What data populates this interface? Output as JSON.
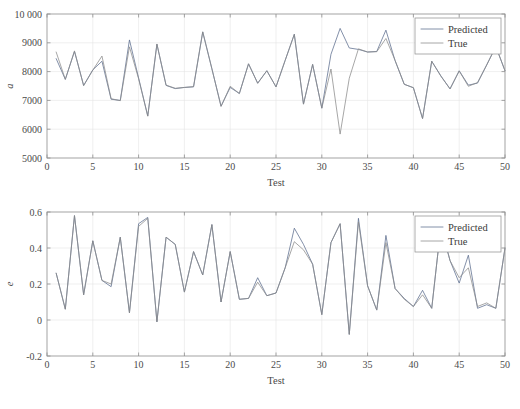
{
  "figure": {
    "background": "#ffffff",
    "panel_count": 2
  },
  "chart_data": [
    {
      "id": "top",
      "type": "line",
      "title": "",
      "xlabel": "Test",
      "ylabel": "a",
      "xlim": [
        0,
        50
      ],
      "ylim": [
        5000,
        10000
      ],
      "xticks": [
        0,
        5,
        10,
        15,
        20,
        25,
        30,
        35,
        40,
        45,
        50
      ],
      "xticklabels": [
        "0",
        "5",
        "10",
        "15",
        "20",
        "25",
        "30",
        "35",
        "40",
        "45",
        "50"
      ],
      "yticks": [
        5000,
        6000,
        7000,
        8000,
        9000,
        10000
      ],
      "yticklabels": [
        "5000",
        "6000",
        "7000",
        "8000",
        "9000",
        "10 000"
      ],
      "grid": true,
      "legend_position": "top-right",
      "x": [
        1,
        2,
        3,
        4,
        5,
        6,
        7,
        8,
        9,
        10,
        11,
        12,
        13,
        14,
        15,
        16,
        17,
        18,
        19,
        20,
        21,
        22,
        23,
        24,
        25,
        26,
        27,
        28,
        29,
        30,
        31,
        32,
        33,
        34,
        35,
        36,
        37,
        38,
        39,
        40,
        41,
        42,
        43,
        44,
        45,
        46,
        47,
        48,
        49,
        50
      ],
      "series": [
        {
          "name": "Predicted",
          "color": "#5a6b8c",
          "values": [
            8450,
            7730,
            8700,
            7520,
            8060,
            8360,
            7040,
            7000,
            9100,
            7780,
            6460,
            8950,
            7520,
            7410,
            7450,
            7470,
            9380,
            8100,
            6800,
            7450,
            7240,
            8270,
            7600,
            8030,
            7470,
            8390,
            9300,
            6870,
            8250,
            6730,
            8600,
            9500,
            8820,
            8770,
            8680,
            8700,
            9440,
            8380,
            7560,
            7440,
            6370,
            8360,
            7850,
            7400,
            8030,
            7530,
            7600,
            8230,
            8870,
            8030
          ]
        },
        {
          "name": "True",
          "color": "#8a8a8a",
          "values": [
            8680,
            7730,
            8720,
            7510,
            8050,
            8540,
            7060,
            6990,
            8860,
            7750,
            6450,
            8960,
            7530,
            7420,
            7450,
            7480,
            9380,
            8100,
            6790,
            7490,
            7240,
            8270,
            7590,
            8030,
            7470,
            8390,
            9290,
            6870,
            8250,
            6730,
            8090,
            5830,
            7770,
            8790,
            8680,
            8690,
            9150,
            8390,
            7560,
            7440,
            6370,
            8360,
            7840,
            7400,
            8020,
            7490,
            7620,
            8230,
            8870,
            8030
          ]
        }
      ]
    },
    {
      "id": "bottom",
      "type": "line",
      "title": "",
      "xlabel": "Test",
      "ylabel": "e",
      "xlim": [
        0,
        50
      ],
      "ylim": [
        -0.2,
        0.6
      ],
      "xticks": [
        0,
        5,
        10,
        15,
        20,
        25,
        30,
        35,
        40,
        45,
        50
      ],
      "xticklabels": [
        "0",
        "5",
        "10",
        "15",
        "20",
        "25",
        "30",
        "35",
        "40",
        "45",
        "50"
      ],
      "yticks": [
        -0.2,
        0,
        0.2,
        0.4,
        0.6
      ],
      "yticklabels": [
        "-0.2",
        "0",
        "0.2",
        "0.4",
        "0.6"
      ],
      "grid": true,
      "legend_position": "top-right",
      "x": [
        1,
        2,
        3,
        4,
        5,
        6,
        7,
        8,
        9,
        10,
        11,
        12,
        13,
        14,
        15,
        16,
        17,
        18,
        19,
        20,
        21,
        22,
        23,
        24,
        25,
        26,
        27,
        28,
        29,
        30,
        31,
        32,
        33,
        34,
        35,
        36,
        37,
        38,
        39,
        40,
        41,
        42,
        43,
        44,
        45,
        46,
        47,
        48,
        49,
        50
      ],
      "series": [
        {
          "name": "Predicted",
          "color": "#5a6b8c",
          "values": [
            0.26,
            0.06,
            0.58,
            0.14,
            0.44,
            0.22,
            0.185,
            0.46,
            0.04,
            0.535,
            0.57,
            -0.01,
            0.46,
            0.42,
            0.155,
            0.38,
            0.25,
            0.53,
            0.1,
            0.38,
            0.115,
            0.12,
            0.235,
            0.135,
            0.15,
            0.29,
            0.51,
            0.42,
            0.31,
            0.03,
            0.43,
            0.535,
            -0.08,
            0.565,
            0.19,
            0.055,
            0.47,
            0.175,
            0.12,
            0.075,
            0.165,
            0.065,
            0.52,
            0.33,
            0.205,
            0.36,
            0.065,
            0.085,
            0.065,
            0.4
          ]
        },
        {
          "name": "True",
          "color": "#8a8a8a",
          "values": [
            0.26,
            0.06,
            0.58,
            0.14,
            0.44,
            0.22,
            0.2,
            0.46,
            0.04,
            0.52,
            0.565,
            -0.01,
            0.46,
            0.42,
            0.155,
            0.38,
            0.25,
            0.53,
            0.1,
            0.38,
            0.115,
            0.12,
            0.21,
            0.135,
            0.15,
            0.29,
            0.435,
            0.39,
            0.31,
            0.03,
            0.43,
            0.535,
            -0.08,
            0.545,
            0.19,
            0.055,
            0.43,
            0.175,
            0.115,
            0.075,
            0.14,
            0.065,
            0.52,
            0.33,
            0.235,
            0.29,
            0.075,
            0.095,
            0.065,
            0.4
          ]
        }
      ]
    }
  ]
}
